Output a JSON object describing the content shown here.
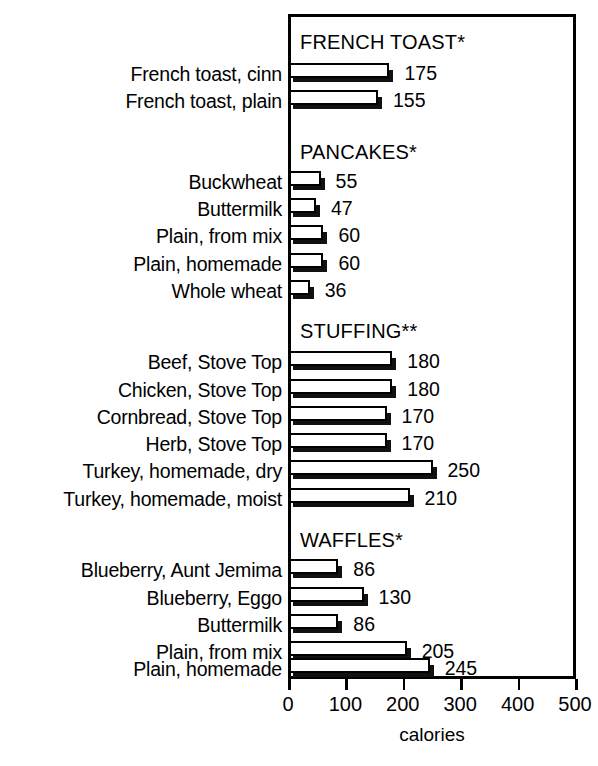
{
  "chart_data": {
    "type": "bar",
    "orientation": "horizontal",
    "title": "",
    "xlabel": "calories",
    "ylabel": "",
    "xlim": [
      0,
      500
    ],
    "xticks": [
      0,
      100,
      200,
      300,
      400,
      500
    ],
    "grid": false,
    "legend": false,
    "value_labels": true,
    "categories": [
      "French toast, cinn",
      "French toast, plain",
      "Buckwheat",
      "Buttermilk",
      "Plain, from mix",
      "Plain, homemade",
      "Whole wheat",
      "Beef, Stove Top",
      "Chicken, Stove Top",
      "Cornbread, Stove Top",
      "Herb, Stove Top",
      "Turkey, homemade, dry",
      "Turkey, homemade, moist",
      "Blueberry, Aunt Jemima",
      "Blueberry, Eggo",
      "Buttermilk",
      "Plain, from mix",
      "Plain, homemade"
    ],
    "values": [
      175,
      155,
      55,
      47,
      60,
      60,
      36,
      180,
      180,
      170,
      170,
      250,
      210,
      86,
      130,
      86,
      205,
      245
    ],
    "groups": [
      {
        "header": "FRENCH TOAST*",
        "items": [
          {
            "label": "French toast, cinn",
            "value": 175
          },
          {
            "label": "French toast, plain",
            "value": 155
          }
        ]
      },
      {
        "header": "PANCAKES*",
        "items": [
          {
            "label": "Buckwheat",
            "value": 55
          },
          {
            "label": "Buttermilk",
            "value": 47
          },
          {
            "label": "Plain, from mix",
            "value": 60
          },
          {
            "label": "Plain, homemade",
            "value": 60
          },
          {
            "label": "Whole wheat",
            "value": 36
          }
        ]
      },
      {
        "header": "STUFFING**",
        "items": [
          {
            "label": "Beef, Stove Top",
            "value": 180
          },
          {
            "label": "Chicken, Stove Top",
            "value": 180
          },
          {
            "label": "Cornbread, Stove Top",
            "value": 170
          },
          {
            "label": "Herb, Stove Top",
            "value": 170
          },
          {
            "label": "Turkey, homemade, dry",
            "value": 250
          },
          {
            "label": "Turkey, homemade, moist",
            "value": 210
          }
        ]
      },
      {
        "header": "WAFFLES*",
        "items": [
          {
            "label": "Blueberry, Aunt Jemima",
            "value": 86
          },
          {
            "label": "Blueberry, Eggo",
            "value": 130
          },
          {
            "label": "Buttermilk",
            "value": 86
          },
          {
            "label": "Plain, from mix",
            "value": 205
          },
          {
            "label": "Plain, homemade",
            "value": 245
          }
        ]
      }
    ],
    "colors": {
      "bar_face": "#ffffff",
      "bar_outline": "#000000",
      "bar_shadow": "#111111",
      "frame": "#000000",
      "text": "#000000",
      "background": "#ffffff"
    }
  }
}
